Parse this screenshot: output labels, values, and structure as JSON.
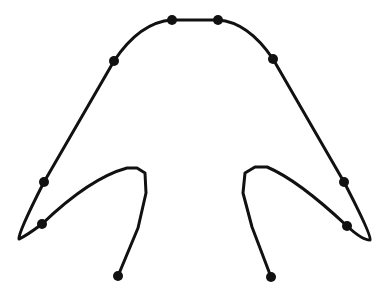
{
  "diagram": {
    "background": "#ffffff",
    "stroke_color": "#111111",
    "stroke_width": 3,
    "dot_color": "#111111",
    "dot_radius": 5,
    "curve_path": "M118,276 L138,228 L146,193 L145,173 L137,168 L127,168 Q90,178 42,224 Q26,236 19,239 Q18,233 44,182 L114,61 Q140,22 172,20 L218,20 Q248,22 273,59 L344,182 Q372,236 370,240 Q362,240 347,226 Q298,180 267,167 L255,167 L245,173 L243,193 L252,227 L271,277",
    "dots": [
      {
        "name": "dot-bottom-left",
        "x": 118,
        "y": 276
      },
      {
        "name": "dot-left-lower",
        "x": 42,
        "y": 224
      },
      {
        "name": "dot-left-upper",
        "x": 44,
        "y": 182
      },
      {
        "name": "dot-upper-left",
        "x": 114,
        "y": 61
      },
      {
        "name": "dot-top-left",
        "x": 172,
        "y": 20
      },
      {
        "name": "dot-top-right",
        "x": 218,
        "y": 20
      },
      {
        "name": "dot-upper-right",
        "x": 273,
        "y": 59
      },
      {
        "name": "dot-right-upper",
        "x": 344,
        "y": 182
      },
      {
        "name": "dot-right-lower",
        "x": 347,
        "y": 226
      },
      {
        "name": "dot-bottom-right",
        "x": 271,
        "y": 277
      }
    ]
  }
}
